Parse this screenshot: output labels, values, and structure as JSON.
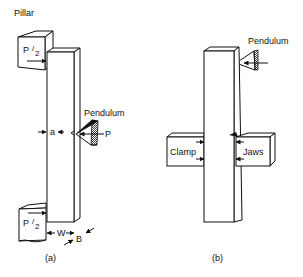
{
  "figure": {
    "panel_a": {
      "caption": "(a)",
      "labels": {
        "pillar": "Pillar",
        "load_top_P": "P",
        "load_top_den": "2",
        "load_bottom_P": "P",
        "load_bottom_den": "2",
        "pendulum": "Pendulum",
        "force": "P",
        "notch_depth": "a",
        "width": "W",
        "thickness": "B"
      }
    },
    "panel_b": {
      "caption": "(b)",
      "labels": {
        "pendulum": "Pendulum",
        "clamp": "Clamp",
        "jaws": "Jaws"
      }
    },
    "colors": {
      "line": "#111111",
      "background": "#ffffff"
    }
  }
}
